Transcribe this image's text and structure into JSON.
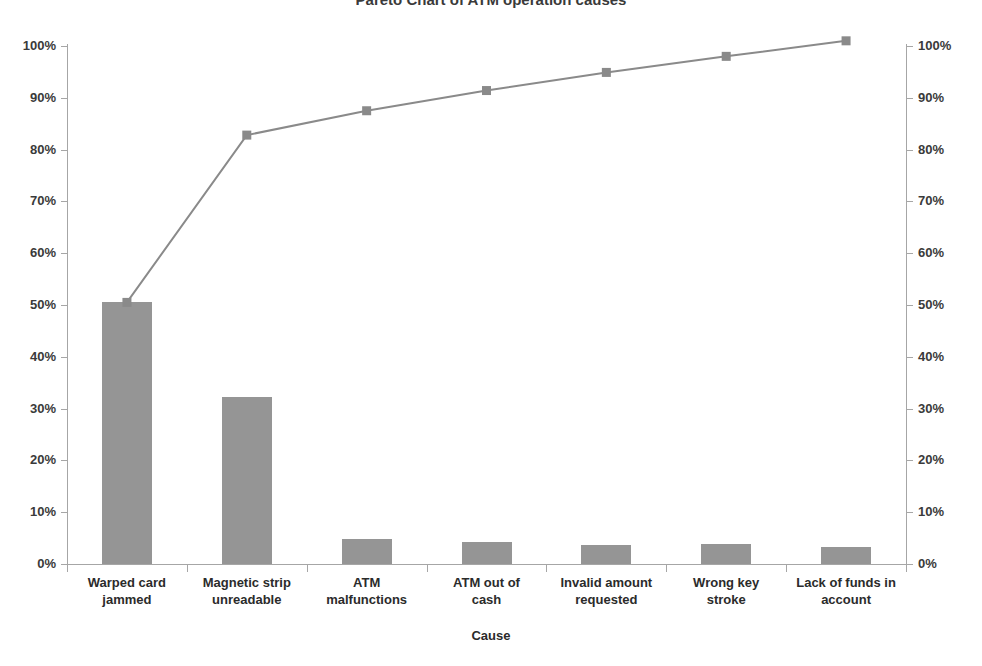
{
  "chart_data": {
    "type": "bar",
    "title": "Pareto Chart of ATM operation causes",
    "xlabel": "Cause",
    "ylabel": "",
    "ylabel_right": "",
    "grid": false,
    "legend": "none",
    "ylim": [
      0,
      1.05
    ],
    "y_tick_labels": [
      "100%",
      "90%",
      "80%",
      "70%",
      "60%",
      "50%",
      "40%",
      "30%",
      "20%",
      "10%",
      "0%"
    ],
    "y_tick_values": [
      100,
      90,
      80,
      70,
      60,
      50,
      40,
      30,
      20,
      10,
      0
    ],
    "y_tick_labels_right": [
      "100%",
      "90%",
      "80%",
      "70%",
      "60%",
      "50%",
      "40%",
      "30%",
      "20%",
      "10%",
      "0%"
    ],
    "y_tick_values_right": [
      100,
      90,
      80,
      70,
      60,
      50,
      40,
      30,
      20,
      10,
      0
    ],
    "categories": [
      "Warped card jammed",
      "Magnetic strip unreadable",
      "ATM malfunctions",
      "ATM out of cash",
      "Invalid amount requested",
      "Wrong key stroke",
      "Lack of funds in account"
    ],
    "category_lines": [
      [
        "Warped card",
        "jammed"
      ],
      [
        "Magnetic strip",
        "unreadable"
      ],
      [
        "ATM",
        "malfunctions"
      ],
      [
        "ATM out of",
        "cash"
      ],
      [
        "Invalid amount",
        "requested"
      ],
      [
        "Wrong key",
        "stroke"
      ],
      [
        "Lack of funds in",
        "account"
      ]
    ],
    "series": [
      {
        "name": "Frequency",
        "type": "bar",
        "values": [
          50.5,
          32.3,
          4.8,
          4.3,
          3.7,
          3.8,
          3.3
        ]
      },
      {
        "name": "Cumulative percentage",
        "type": "line",
        "values": [
          50.5,
          82.8,
          87.5,
          91.4,
          94.9,
          98.0,
          101.0
        ]
      }
    ],
    "colors": {
      "bar": "#959595",
      "line": "#8a8a8a",
      "marker": "#8a8a8a",
      "axis": "#a6a6a6",
      "text": "#2b2b2b"
    }
  }
}
